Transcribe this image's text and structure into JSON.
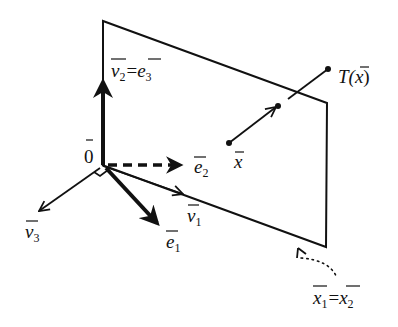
{
  "diagram": {
    "colors": {
      "ink": "#111111",
      "background": "#ffffff"
    },
    "labels": {
      "origin": "0",
      "v2": "v",
      "v2_sub": "2",
      "e3": "e",
      "e3_sub": "3",
      "equals": "=",
      "e2": "e",
      "e2_sub": "2",
      "v1": "v",
      "v1_sub": "1",
      "e1": "e",
      "e1_sub": "1",
      "v3": "v",
      "v3_sub": "3",
      "x": "x",
      "Tx_prefix": "T(",
      "Tx_var": "x",
      "Tx_suffix": ")",
      "x1": "x",
      "x1_sub": "1",
      "x2": "x",
      "x2_sub": "2"
    },
    "elements": {
      "plane": "parallelogram plane through origin",
      "vectors": [
        "v2 = e3 (vertical, bold)",
        "e2 (dashed)",
        "v1",
        "e1 (bold)",
        "v3"
      ],
      "segment": "x to T(x) passing through plane",
      "annotation": "dotted callout to plane corner: x1 = x2"
    }
  }
}
